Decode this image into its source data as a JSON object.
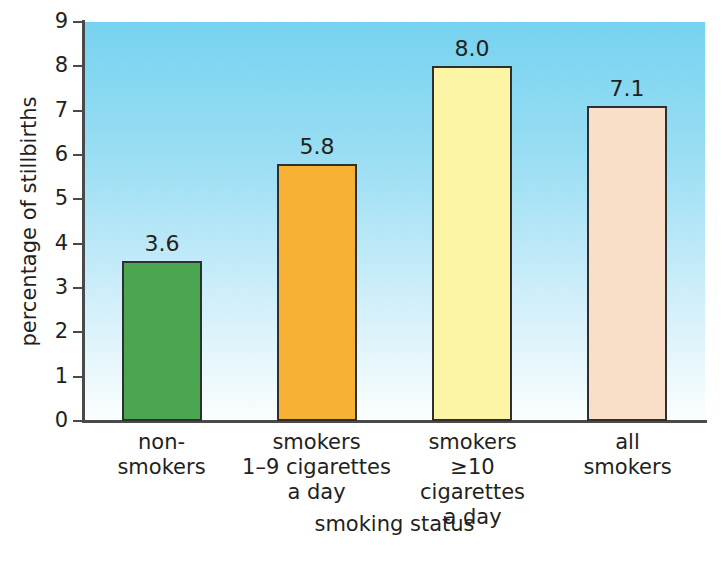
{
  "chart_data": {
    "type": "bar",
    "title": "",
    "xlabel": "smoking status",
    "ylabel": "percentage of stillbirths",
    "categories": [
      "non-smokers",
      "smokers 1–9 cigarettes a day",
      "smokers ≥10 cigarettes a day",
      "all smokers"
    ],
    "category_lines": [
      [
        "non-",
        "smokers"
      ],
      [
        "smokers",
        "1–9 cigarettes",
        "a day"
      ],
      [
        "smokers",
        "≥10 cigarettes",
        "a day"
      ],
      [
        "all",
        "smokers"
      ]
    ],
    "values": [
      3.6,
      5.8,
      8.0,
      7.1
    ],
    "value_labels": [
      "3.6",
      "5.8",
      "8.0",
      "7.1"
    ],
    "bar_colors": [
      "#4aa650",
      "#f7b236",
      "#fdf5a6",
      "#fadfc8"
    ],
    "bar_border_color": "#2f2f2f",
    "ylim": [
      0,
      9
    ],
    "ytick_labels": [
      "9",
      "8",
      "7",
      "6",
      "5",
      "4",
      "3",
      "2",
      "1",
      "0"
    ],
    "ytick_values": [
      9,
      8,
      7,
      6,
      5,
      4,
      3,
      2,
      1,
      0
    ],
    "grid": false,
    "legend": "none",
    "plot_background_top_color": "#74d2f0",
    "plot_background_bottom_color": "#fbfeff",
    "axis_color": "#4a4a4a",
    "text_color": "#231f20"
  },
  "figure": {
    "caption_sliver": " "
  }
}
